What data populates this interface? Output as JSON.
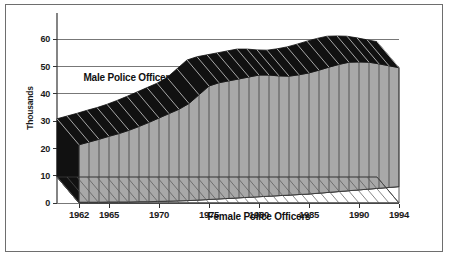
{
  "chart_data": {
    "type": "area",
    "title": "",
    "subtitle": "",
    "xlabel": "",
    "ylabel": "Thousands",
    "stacked": true,
    "three_d": true,
    "grid": true,
    "legend_position": "inline-annotations",
    "xlim": [
      1962,
      1994
    ],
    "ylim": [
      0,
      60
    ],
    "yticks": [
      0,
      10,
      20,
      30,
      40,
      50,
      60
    ],
    "ytick_labels": [
      "0",
      "10",
      "20",
      "30",
      "40",
      "50",
      "60"
    ],
    "xticks": [
      1962,
      1965,
      1970,
      1975,
      1980,
      1985,
      1990,
      1994
    ],
    "xtick_labels": [
      "1962",
      "1965",
      "1970",
      "1975",
      "1980",
      "1985",
      "1990",
      "1994"
    ],
    "x": [
      1962,
      1963,
      1964,
      1965,
      1966,
      1967,
      1968,
      1969,
      1970,
      1971,
      1972,
      1973,
      1974,
      1975,
      1976,
      1977,
      1978,
      1979,
      1980,
      1981,
      1982,
      1983,
      1984,
      1985,
      1986,
      1987,
      1988,
      1989,
      1990,
      1991,
      1992,
      1993,
      1994
    ],
    "series": [
      {
        "name": "Female Police Officers",
        "color": "#ffffff",
        "values": [
          0.3,
          0.3,
          0.3,
          0.4,
          0.4,
          0.4,
          0.5,
          0.5,
          0.6,
          0.7,
          0.8,
          0.9,
          1.1,
          1.3,
          1.5,
          1.7,
          1.9,
          2.1,
          2.3,
          2.5,
          2.7,
          2.9,
          3.1,
          3.3,
          3.6,
          3.9,
          4.2,
          4.5,
          4.8,
          5.1,
          5.4,
          5.7,
          6.0
        ]
      },
      {
        "name": "Male Police Officers",
        "color": "#a8a8a8",
        "values": [
          21.0,
          22.0,
          23.0,
          24.0,
          25.0,
          26.2,
          27.5,
          29.0,
          30.5,
          32.0,
          33.5,
          35.5,
          38.5,
          41.5,
          42.5,
          43.0,
          43.5,
          44.0,
          44.5,
          44.3,
          43.8,
          43.5,
          43.8,
          44.3,
          45.0,
          45.8,
          46.5,
          47.0,
          46.8,
          46.4,
          45.5,
          44.5,
          43.5
        ]
      }
    ],
    "totals": [
      21.3,
      22.3,
      23.3,
      24.4,
      25.4,
      26.6,
      28.0,
      29.5,
      31.1,
      32.7,
      34.3,
      36.4,
      39.6,
      42.8,
      44.0,
      44.7,
      45.4,
      46.1,
      46.8,
      46.8,
      46.5,
      46.4,
      46.9,
      47.6,
      48.6,
      49.7,
      50.7,
      51.5,
      51.6,
      51.5,
      50.9,
      50.2,
      49.5
    ],
    "annotations": [
      {
        "text": "Male Police Officers",
        "x": 1966.5,
        "y": 44.5
      },
      {
        "text": "Female Police Officers",
        "x": 1979.5,
        "y": 1.2
      }
    ]
  },
  "axes": {
    "y_axis_title": "Thousands",
    "y_labels": [
      "60",
      "50",
      "40",
      "30",
      "20",
      "10",
      "0"
    ],
    "x_labels": [
      "1962",
      "1965",
      "1970",
      "1975",
      "1980",
      "1985",
      "1990",
      "1994"
    ]
  },
  "labels": {
    "male_series": "Male Police Officers",
    "female_series": "Female Police Officers"
  },
  "colors": {
    "male_front": "#a8a8a8",
    "male_top": "#111111",
    "male_side": "#111111",
    "female_front": "#ffffff",
    "female_top": "#f2f2f2",
    "gridline": "#777777",
    "axis": "#333333",
    "frame": "#6e6e6e",
    "text": "#1a1a1a"
  }
}
